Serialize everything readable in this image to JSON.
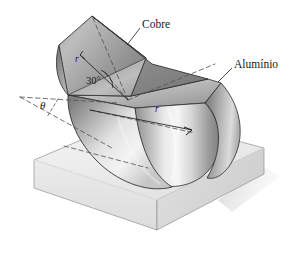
{
  "figure": {
    "type": "engineering-diagram",
    "background_color": "#ffffff",
    "labels": {
      "copper": "Cobre",
      "aluminum": "Alumínio",
      "angle_wedge": "30°",
      "angle_theta": "θ",
      "radius_upper": "r",
      "radius_lower": "r"
    },
    "colors": {
      "outline": "#262626",
      "dashed_line": "#555555",
      "copper_light": "#c9c9c9",
      "copper_dark": "#8d8d8d",
      "aluminum_light": "#f2f2f2",
      "aluminum_dark": "#9a9a9a",
      "block_top": "#f0f0f0",
      "block_front": "#e4e4e4",
      "block_side": "#d6d6d6",
      "shadow": "#d9d9d9"
    }
  }
}
